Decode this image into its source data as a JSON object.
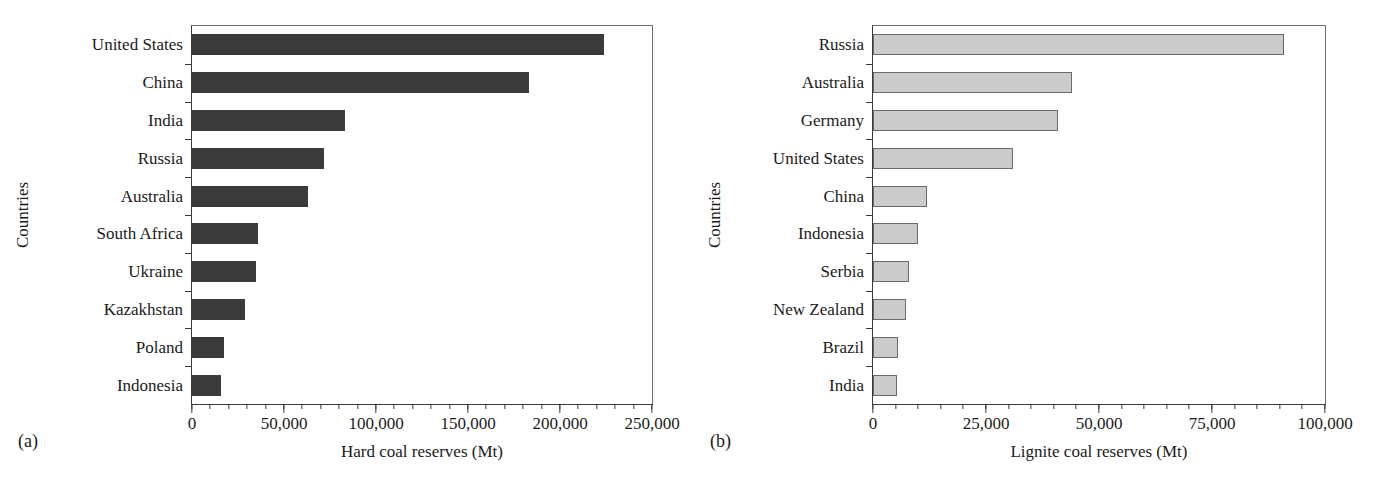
{
  "figure": {
    "panels": [
      {
        "caption": "(a)",
        "ylabel": "Countries",
        "xlabel": "Hard coal reserves (Mt)"
      },
      {
        "caption": "(b)",
        "ylabel": "Countries",
        "xlabel": "Lignite coal reserves (Mt)"
      }
    ]
  },
  "colors": {
    "hard_coal_bar": "#3b3b3b",
    "lignite_bar": "#cbcbcb",
    "lignite_bar_edge": "#6a6a6a",
    "axis": "#3a3a3a",
    "text": "#1a1a1a"
  },
  "chart_data": [
    {
      "type": "bar",
      "orientation": "horizontal",
      "panel": "(a)",
      "title": "",
      "xlabel": "Hard coal reserves (Mt)",
      "ylabel": "Countries",
      "xlim": [
        0,
        250000
      ],
      "xticks": [
        0,
        50000,
        100000,
        150000,
        200000,
        250000
      ],
      "xticklabels": [
        "0",
        "50,000",
        "100,000",
        "150,000",
        "200,000",
        "250,000"
      ],
      "minor_tick_interval": 10000,
      "grid": false,
      "legend": "none",
      "categories": [
        "United States",
        "China",
        "India",
        "Russia",
        "Australia",
        "South Africa",
        "Ukraine",
        "Kazakhstan",
        "Poland",
        "Indonesia"
      ],
      "values": [
        224000,
        183000,
        83000,
        72000,
        63000,
        36000,
        35000,
        29000,
        17500,
        16000
      ]
    },
    {
      "type": "bar",
      "orientation": "horizontal",
      "panel": "(b)",
      "title": "",
      "xlabel": "Lignite coal reserves (Mt)",
      "ylabel": "Countries",
      "xlim": [
        0,
        100000
      ],
      "xticks": [
        0,
        25000,
        50000,
        75000,
        100000
      ],
      "xticklabels": [
        "0",
        "25,000",
        "50,000",
        "75,000",
        "100,000"
      ],
      "minor_tick_interval": 5000,
      "grid": false,
      "legend": "none",
      "categories": [
        "Russia",
        "Australia",
        "Germany",
        "United States",
        "China",
        "Indonesia",
        "Serbia",
        "New Zealand",
        "Brazil",
        "India"
      ],
      "values": [
        91000,
        44000,
        41000,
        31000,
        12000,
        10000,
        8000,
        7300,
        5500,
        5300
      ]
    }
  ]
}
